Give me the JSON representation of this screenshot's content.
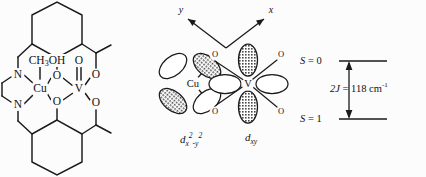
{
  "figure": {
    "background_color": "#fcfcfc",
    "line_color": "#1a1a1a"
  },
  "structure": {
    "name": "molecular-structure-diagram",
    "atoms": {
      "copper": "Cu",
      "vanadium": "V",
      "nitrogen_top": "N",
      "nitrogen_bottom": "N",
      "oxygen_bridge_top": "O",
      "oxygen_bridge_bottom": "O",
      "oxygen_vanadyl": "O",
      "oxygen_top_right": "O",
      "oxygen_bottom_right": "O",
      "methanol_ligand": "CH3OH",
      "methanol_prefix": "CH",
      "methanol_sub": "3",
      "methanol_suffix": "OH"
    }
  },
  "orbitals": {
    "name": "magnetic-orbital-diagram",
    "axis_x_label": "x",
    "axis_y_label": "y",
    "center_left_label": "Cu",
    "center_right_label": "V",
    "bridge_oxygen_label": "O",
    "terminal_oxygen_label": "O",
    "captions": [
      {
        "id": "cu-orbital",
        "d": "d",
        "sub": "x",
        "sup": "2",
        "sub2": "-y",
        "sup2": "2",
        "full": "dx2-y2"
      },
      {
        "id": "v-orbital",
        "d": "d",
        "sub": "xy",
        "full": "dxy"
      }
    ],
    "oxygen_labels": [
      "O",
      "O",
      "O",
      "O"
    ]
  },
  "energy_diagram": {
    "name": "singlet-triplet-energy-diagram",
    "upper_level_label": "S = 0",
    "upper_level_symbol": "S",
    "upper_level_value": "= 0",
    "lower_level_label": "S = 1",
    "lower_level_symbol": "S",
    "lower_level_value": "= 1",
    "gap_symbol": "2J",
    "gap_value": "= 118 cm",
    "gap_exponent": "-1",
    "gap_label_full": "2J = 118 cm-1",
    "gap_magnitude": 118,
    "gap_units": "cm^-1"
  }
}
